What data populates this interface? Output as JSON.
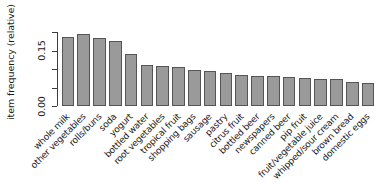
{
  "chart_data": {
    "type": "bar",
    "title": "",
    "xlabel": "",
    "ylabel": "item frequency (relative)",
    "ylim": [
      0,
      0.2
    ],
    "grid": false,
    "legend": null,
    "bar_color": "#9a9a9a",
    "bar_border_color": "#555555",
    "axis_color": "#3d3d3d",
    "y_ticks": [
      {
        "value": 0.0,
        "label": "0.00",
        "labeled": true
      },
      {
        "value": 0.05,
        "label": "",
        "labeled": false
      },
      {
        "value": 0.1,
        "label": "",
        "labeled": false
      },
      {
        "value": 0.15,
        "label": "0.15",
        "labeled": true
      },
      {
        "value": 0.2,
        "label": "",
        "labeled": false
      }
    ],
    "categories": [
      "whole milk",
      "other vegetables",
      "rolls/buns",
      "soda",
      "yogurt",
      "bottled water",
      "root vegetables",
      "tropical fruit",
      "shopping bags",
      "sausage",
      "pastry",
      "citrus fruit",
      "bottled beer",
      "newspapers",
      "canned beer",
      "pip fruit",
      "fruit/vegetable juice",
      "whipped/sour cream",
      "brown bread",
      "domestic eggs"
    ],
    "values": [
      0.1856,
      0.1935,
      0.1839,
      0.1744,
      0.1395,
      0.1105,
      0.1089,
      0.1049,
      0.0985,
      0.094,
      0.0889,
      0.0828,
      0.0805,
      0.0799,
      0.0777,
      0.0756,
      0.0723,
      0.0717,
      0.0649,
      0.0635
    ]
  }
}
